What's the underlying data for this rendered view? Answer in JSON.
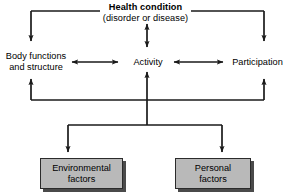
{
  "diagram": {
    "health_condition": {
      "title": "Health condition",
      "subtitle": "(disorder or disease)"
    },
    "components": {
      "body_functions": "Body functions\nand structure",
      "body_functions_line1": "Body functions",
      "body_functions_line2": "and structure",
      "activity": "Activity",
      "participation": "Participation"
    },
    "contextual_factors": {
      "environmental_line1": "Environmental",
      "environmental_line2": "factors",
      "personal_line1": "Personal",
      "personal_line2": "factors"
    },
    "colors": {
      "line": "#1a1a1a",
      "box_fill": "#b9b9b9",
      "box_border": "#2b2b2b",
      "box_shadow": "#4a4a4a",
      "background": "#ffffff",
      "text": "#000000"
    }
  }
}
